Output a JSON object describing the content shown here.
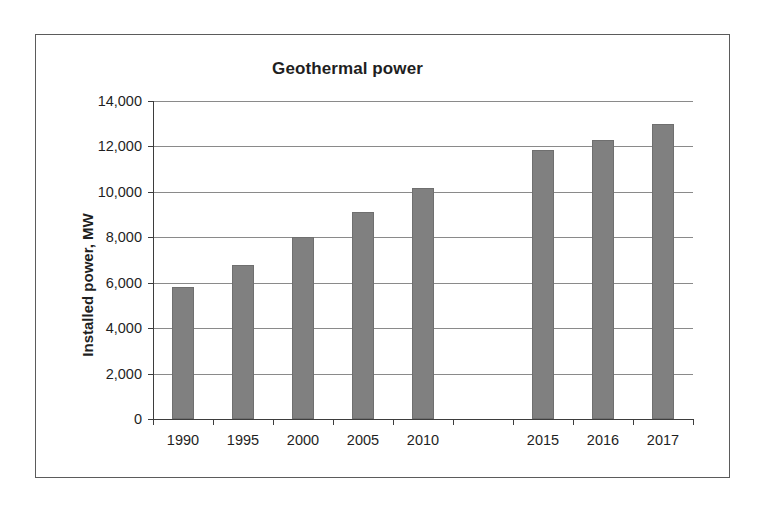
{
  "chart_data": {
    "type": "bar",
    "title": "Geothermal power",
    "xlabel": "",
    "ylabel": "Installed power, MW",
    "categories": [
      "1990",
      "1995",
      "2000",
      "2005",
      "2010",
      "",
      "2015",
      "2016",
      "2017"
    ],
    "values": [
      5800,
      6800,
      8000,
      9100,
      10150,
      null,
      11850,
      12300,
      13000
    ],
    "ylim": [
      0,
      14000
    ],
    "ytick_values": [
      0,
      2000,
      4000,
      6000,
      8000,
      10000,
      12000,
      14000
    ],
    "ytick_labels": [
      "0",
      "2,000",
      "4,000",
      "6,000",
      "8,000",
      "10,000",
      "12,000",
      "14,000"
    ],
    "grid": true,
    "legend": false,
    "series": [
      {
        "name": "Installed power",
        "color": "#808080",
        "values": [
          5800,
          6800,
          8000,
          9100,
          10150,
          null,
          11850,
          12300,
          13000
        ]
      }
    ]
  },
  "figure": {
    "frame_color": "#5b5b5b",
    "axis_color": "#3d3d3d",
    "grid_color": "#8a8a8a",
    "bar_color": "#808080",
    "background": "#ffffff"
  }
}
